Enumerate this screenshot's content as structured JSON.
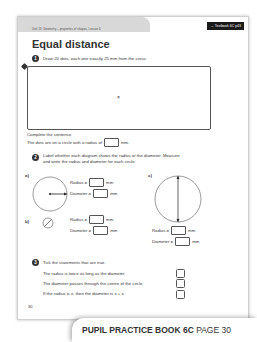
{
  "header": {
    "breadcrumb": "Unit 13: Geometry – properties of shapes, Lesson 6",
    "textbook_ref": "→ Textbook 6C p43"
  },
  "title": "Equal distance",
  "q1": {
    "number": "1",
    "instruction": "Draw 20 dots, each one exactly 25 mm from the cross.",
    "cross": "×",
    "complete_label": "Complete the sentence.",
    "sentence_before": "The dots are on a circle with a radius of",
    "sentence_after": "mm."
  },
  "q2": {
    "number": "2",
    "instruction_line1": "Label whether each diagram shows the radius or the diameter. Measure",
    "instruction_line2": "and write the radius and diameter for each circle.",
    "parts": [
      {
        "label": "a)",
        "radius_label": "Radius =",
        "diameter_label": "Diameter =",
        "unit": "mm"
      },
      {
        "label": "b)",
        "radius_label": "Radius =",
        "diameter_label": "Diameter =",
        "unit": "mm"
      },
      {
        "label": "c)",
        "radius_label": "Radius =",
        "diameter_label": "Diameter =",
        "unit": "mm"
      }
    ]
  },
  "q3": {
    "number": "3",
    "instruction": "Tick the statements that are true.",
    "statements": [
      "The radius is twice as long as the diameter.",
      "The diameter passes through the centre of the circle.",
      "If the radius is x, then the diameter is x + x."
    ]
  },
  "page_number": "30",
  "footer": {
    "book": "PUPIL PRACTICE BOOK 6C",
    "page": "PAGE 30"
  }
}
